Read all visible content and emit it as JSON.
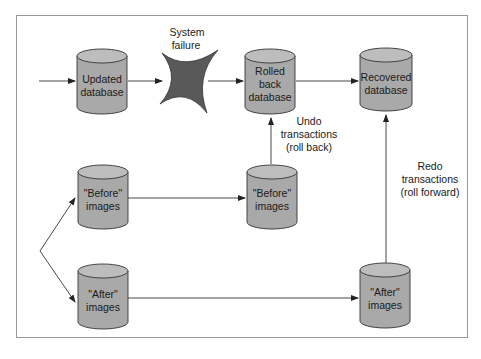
{
  "diagram": {
    "type": "database recovery flow",
    "colors": {
      "cylinder_fill": "#a9a9a9",
      "cylinder_top": "#bdbdbd",
      "stroke": "#333333",
      "failure_star": "#595959",
      "frame": "#9a9a9a"
    },
    "nodes": {
      "updated_db": {
        "line1": "Updated",
        "line2": "database"
      },
      "failure": {
        "line1": "System",
        "line2": "failure"
      },
      "rolled_back_db": {
        "line1": "Rolled",
        "line2": "back",
        "line3": "database"
      },
      "recovered_db": {
        "line1": "Recovered",
        "line2": "database"
      },
      "before_src": {
        "line1": "\"Before\"",
        "line2": "images"
      },
      "before_dst": {
        "line1": "\"Before\"",
        "line2": "images"
      },
      "after_src": {
        "line1": "\"After\"",
        "line2": "images"
      },
      "after_dst": {
        "line1": "\"After\"",
        "line2": "images"
      }
    },
    "edge_labels": {
      "undo": {
        "line1": "Undo",
        "line2": "transactions",
        "line3": "(roll back)"
      },
      "redo": {
        "line1": "Redo",
        "line2": "transactions",
        "line3": "(roll forward)"
      }
    }
  }
}
